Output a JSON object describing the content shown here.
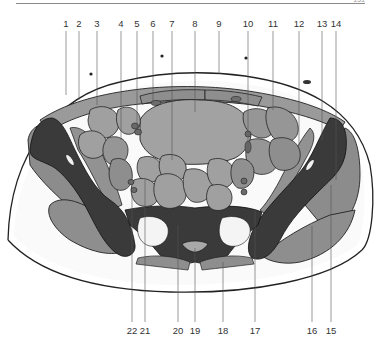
{
  "page": {
    "number": "151"
  },
  "diagram": {
    "type": "anatomical-cross-section",
    "colors": {
      "background": "#ffffff",
      "bone": "#3a3a3a",
      "muscle": "#8c8c8c",
      "muscle_light": "#a4a4a4",
      "organ": "#9c9c9c",
      "vessel": "#6e6e6e",
      "fat": "#f2f2f2",
      "outline": "#222222",
      "leader_line": "#555555"
    },
    "top_labels": [
      {
        "n": "1",
        "x": 66
      },
      {
        "n": "2",
        "x": 79
      },
      {
        "n": "3",
        "x": 97
      },
      {
        "n": "4",
        "x": 121
      },
      {
        "n": "5",
        "x": 137
      },
      {
        "n": "6",
        "x": 153
      },
      {
        "n": "7",
        "x": 172
      },
      {
        "n": "8",
        "x": 195
      },
      {
        "n": "9",
        "x": 219
      },
      {
        "n": "10",
        "x": 248
      },
      {
        "n": "11",
        "x": 273
      },
      {
        "n": "12",
        "x": 299
      },
      {
        "n": "13",
        "x": 322
      },
      {
        "n": "14",
        "x": 336
      }
    ],
    "bottom_labels": [
      {
        "n": "22",
        "x": 132
      },
      {
        "n": "21",
        "x": 145
      },
      {
        "n": "20",
        "x": 178
      },
      {
        "n": "19",
        "x": 195
      },
      {
        "n": "18",
        "x": 223
      },
      {
        "n": "17",
        "x": 255
      },
      {
        "n": "16",
        "x": 312
      },
      {
        "n": "15",
        "x": 331
      }
    ]
  }
}
